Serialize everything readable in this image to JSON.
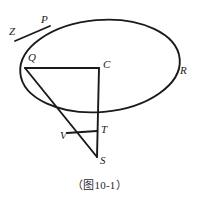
{
  "figure": {
    "caption": "（图10-1）",
    "stroke_color": "#1a1a1a",
    "background_color": "#ffffff",
    "labels": [
      {
        "id": "P",
        "text": "P",
        "x": 41,
        "y": 14
      },
      {
        "id": "Z",
        "text": "Z",
        "x": 9,
        "y": 26
      },
      {
        "id": "Q",
        "text": "Q",
        "x": 28,
        "y": 52
      },
      {
        "id": "C",
        "text": "C",
        "x": 103,
        "y": 59
      },
      {
        "id": "R",
        "text": "R",
        "x": 180,
        "y": 65
      },
      {
        "id": "V",
        "text": "V",
        "x": 60,
        "y": 130
      },
      {
        "id": "T",
        "text": "T",
        "x": 101,
        "y": 124
      },
      {
        "id": "S",
        "text": "S",
        "x": 100,
        "y": 155
      }
    ],
    "ellipse": {
      "cx": 100,
      "cy": 66,
      "rx": 80,
      "ry": 46,
      "rotation_deg": -5
    },
    "segments": [
      {
        "id": "tangent-ZP",
        "from": "Z",
        "to": "P",
        "x1": 15,
        "y1": 41,
        "x2": 50,
        "y2": 26
      },
      {
        "id": "radius-QC",
        "from": "Q",
        "to": "C",
        "x1": 25,
        "y1": 68,
        "x2": 99,
        "y2": 68
      },
      {
        "id": "axis-CS",
        "from": "C",
        "to": "S",
        "x1": 99,
        "y1": 68,
        "x2": 97,
        "y2": 157
      },
      {
        "id": "slant-QS",
        "from": "Q",
        "to": "S",
        "x1": 25,
        "y1": 68,
        "x2": 97,
        "y2": 157
      },
      {
        "id": "chord-VT",
        "from": "V",
        "to": "T",
        "x1": 67,
        "y1": 133,
        "x2": 97,
        "y2": 131
      }
    ]
  }
}
